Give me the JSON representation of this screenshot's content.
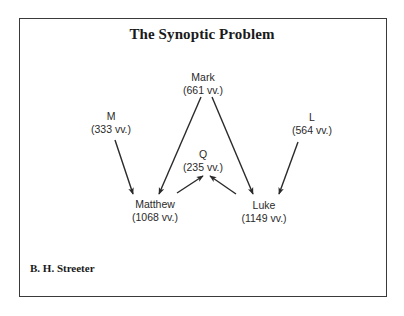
{
  "diagram": {
    "title": "The Synoptic Problem",
    "author": "B. H. Streeter",
    "nodes": {
      "mark": {
        "name": "Mark",
        "verses": "(661 vv.)"
      },
      "m": {
        "name": "M",
        "verses": "(333 vv.)"
      },
      "l": {
        "name": "L",
        "verses": "(564 vv.)"
      },
      "q": {
        "name": "Q",
        "verses": "(235 vv.)"
      },
      "matthew": {
        "name": "Matthew",
        "verses": "(1068 vv.)"
      },
      "luke": {
        "name": "Luke",
        "verses": "(1149 vv.)"
      }
    },
    "edges": [
      {
        "from": "Mark",
        "to": "Matthew"
      },
      {
        "from": "Mark",
        "to": "Luke"
      },
      {
        "from": "M",
        "to": "Matthew"
      },
      {
        "from": "L",
        "to": "Luke"
      },
      {
        "from": "Matthew",
        "to": "Q"
      },
      {
        "from": "Luke",
        "to": "Q"
      }
    ],
    "colors": {
      "line": "#2a2a2a",
      "text": "#1a1a1a",
      "border": "#3a3a3a",
      "background": "#ffffff"
    }
  }
}
